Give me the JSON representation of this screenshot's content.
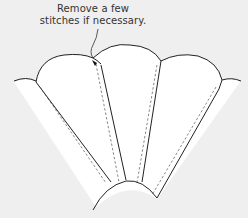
{
  "annotation": {
    "line1": "Remove a few",
    "line2": "stitches if necessary."
  },
  "colors": {
    "background": "#efefef",
    "fabric": "#ffffff",
    "outline": "#222222",
    "stitch_line": "#555555"
  },
  "diagram": {
    "blade_count": 3,
    "partial_blades": 2
  }
}
